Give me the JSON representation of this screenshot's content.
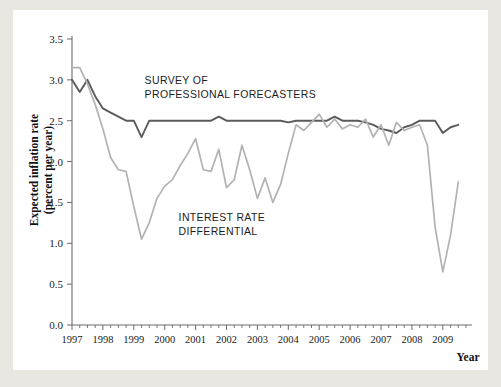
{
  "chart_data": {
    "type": "line",
    "title": "",
    "xlabel": "Year",
    "ylabel": "Expected inflation rate (percent per year)",
    "ylabel_line1": "Expected inflation rate",
    "ylabel_line2": "(percent per year)",
    "xlim": [
      1997.0,
      2009.75
    ],
    "ylim": [
      0.0,
      3.5
    ],
    "yticks": [
      "0.0",
      "0.5",
      "1.0",
      "1.5",
      "2.0",
      "2.5",
      "3.0",
      "3.5"
    ],
    "ytick_values": [
      0.0,
      0.5,
      1.0,
      1.5,
      2.0,
      2.5,
      3.0,
      3.5
    ],
    "xticks": [
      "1997",
      "1998",
      "1999",
      "2000",
      "2001",
      "2002",
      "2003",
      "2004",
      "2005",
      "2006",
      "2007",
      "2008",
      "2009"
    ],
    "xtick_values": [
      1997,
      1998,
      1999,
      2000,
      2001,
      2002,
      2003,
      2004,
      2005,
      2006,
      2007,
      2008,
      2009
    ],
    "minor_ticks_per_year": 4,
    "grid": false,
    "legend_position": "inline-annotation",
    "annotations": [
      {
        "name": "survey-of-professional-forecasters",
        "line1": "SURVEY OF",
        "line2": "PROFESSIONAL FORECASTERS",
        "x": 1999.35,
        "y": 2.95
      },
      {
        "name": "interest-rate-differential",
        "line1": "INTEREST RATE",
        "line2": "DIFFERENTIAL",
        "x": 2000.45,
        "y": 1.27
      }
    ],
    "series": [
      {
        "name": "Survey of Professional Forecasters",
        "color": "#5a5a5a",
        "x": [
          1997.0,
          1997.25,
          1997.5,
          1997.75,
          1998.0,
          1998.25,
          1998.5,
          1998.75,
          1999.0,
          1999.25,
          1999.5,
          1999.75,
          2000.0,
          2000.25,
          2000.5,
          2000.75,
          2001.0,
          2001.25,
          2001.5,
          2001.75,
          2002.0,
          2002.25,
          2002.5,
          2002.75,
          2003.0,
          2003.25,
          2003.5,
          2003.75,
          2004.0,
          2004.25,
          2004.5,
          2004.75,
          2005.0,
          2005.25,
          2005.5,
          2005.75,
          2006.0,
          2006.25,
          2006.5,
          2006.75,
          2007.0,
          2007.25,
          2007.5,
          2007.75,
          2008.0,
          2008.25,
          2008.5,
          2008.75,
          2009.0,
          2009.25,
          2009.5
        ],
        "values": [
          3.0,
          2.85,
          3.0,
          2.8,
          2.65,
          2.6,
          2.55,
          2.5,
          2.5,
          2.3,
          2.5,
          2.5,
          2.5,
          2.5,
          2.5,
          2.5,
          2.5,
          2.5,
          2.5,
          2.55,
          2.5,
          2.5,
          2.5,
          2.5,
          2.5,
          2.5,
          2.5,
          2.5,
          2.48,
          2.5,
          2.5,
          2.5,
          2.5,
          2.5,
          2.55,
          2.5,
          2.5,
          2.5,
          2.48,
          2.45,
          2.4,
          2.38,
          2.35,
          2.42,
          2.45,
          2.5,
          2.5,
          2.5,
          2.35,
          2.42,
          2.45
        ]
      },
      {
        "name": "Interest rate differential",
        "color": "#b2b2b2",
        "x": [
          1997.0,
          1997.25,
          1997.5,
          1997.75,
          1998.0,
          1998.25,
          1998.5,
          1998.75,
          1999.0,
          1999.25,
          1999.5,
          1999.75,
          2000.0,
          2000.25,
          2000.5,
          2000.75,
          2001.0,
          2001.25,
          2001.5,
          2001.75,
          2002.0,
          2002.25,
          2002.5,
          2002.75,
          2003.0,
          2003.25,
          2003.5,
          2003.75,
          2004.0,
          2004.25,
          2004.5,
          2004.75,
          2005.0,
          2005.25,
          2005.5,
          2005.75,
          2006.0,
          2006.25,
          2006.5,
          2006.75,
          2007.0,
          2007.25,
          2007.5,
          2007.75,
          2008.0,
          2008.25,
          2008.5,
          2008.75,
          2009.0,
          2009.25,
          2009.5
        ],
        "values": [
          3.15,
          3.15,
          2.95,
          2.7,
          2.4,
          2.05,
          1.9,
          1.88,
          1.45,
          1.05,
          1.25,
          1.55,
          1.7,
          1.78,
          1.95,
          2.1,
          2.28,
          1.9,
          1.88,
          2.15,
          1.68,
          1.78,
          2.2,
          1.9,
          1.55,
          1.8,
          1.5,
          1.72,
          2.1,
          2.45,
          2.38,
          2.48,
          2.58,
          2.42,
          2.52,
          2.4,
          2.45,
          2.42,
          2.52,
          2.3,
          2.45,
          2.2,
          2.48,
          2.38,
          2.42,
          2.45,
          2.2,
          1.2,
          0.65,
          1.1,
          1.75
        ]
      }
    ]
  }
}
